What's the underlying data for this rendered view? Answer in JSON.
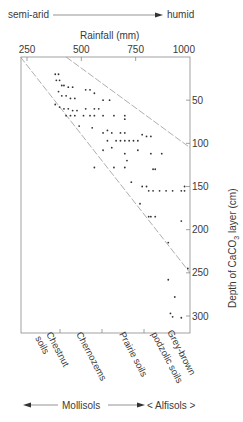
{
  "header": {
    "left_label": "semi-arid",
    "right_label": "humid"
  },
  "footer": {
    "left_label": "Mollisols",
    "right_label": "< Alfisols >"
  },
  "soil_labels": [
    {
      "line1": "Chestnut",
      "line2": "soils"
    },
    {
      "line1": "Chernozems",
      "line2": ""
    },
    {
      "line1": "Prairie soils",
      "line2": ""
    },
    {
      "line1": "Grey-brown",
      "line2": "podzolic soils"
    }
  ],
  "colors": {
    "axis": "#8a8a8a",
    "point": "#333333",
    "dashed": "#9a9a9a",
    "text": "#3a3a3a"
  },
  "chart_data": {
    "type": "scatter",
    "title": "",
    "xlabel": "Rainfall (mm)",
    "ylabel": "Depth of CaCO3 layer (cm)",
    "x_ticks": [
      250,
      500,
      750,
      1000
    ],
    "y_ticks": [
      50,
      100,
      150,
      200,
      250,
      300
    ],
    "xlim": [
      220,
      1000
    ],
    "ylim": [
      0,
      320
    ],
    "x_axis_position": "top",
    "y_axis_position": "right",
    "y_inverted": true,
    "grid": false,
    "legend": null,
    "annotations": [
      "semi-arid → humid",
      "Mollisols",
      "< Alfisols >",
      "Chestnut soils",
      "Chernozems",
      "Prairie soils",
      "Grey-brown podzolic soils"
    ],
    "envelope_lines": [
      {
        "name": "lower-bound",
        "points": [
          [
            220,
            0
          ],
          [
            1000,
            250
          ]
        ]
      },
      {
        "name": "upper-bound",
        "points": [
          [
            430,
            0
          ],
          [
            1000,
            105
          ]
        ]
      }
    ],
    "points": [
      [
        380,
        20
      ],
      [
        395,
        20
      ],
      [
        385,
        27
      ],
      [
        400,
        27
      ],
      [
        410,
        33
      ],
      [
        420,
        33
      ],
      [
        440,
        35
      ],
      [
        460,
        35
      ],
      [
        395,
        40
      ],
      [
        410,
        45
      ],
      [
        430,
        45
      ],
      [
        450,
        48
      ],
      [
        470,
        48
      ],
      [
        380,
        55
      ],
      [
        400,
        58
      ],
      [
        420,
        60
      ],
      [
        440,
        60
      ],
      [
        460,
        62
      ],
      [
        480,
        62
      ],
      [
        520,
        38
      ],
      [
        540,
        38
      ],
      [
        560,
        42
      ],
      [
        600,
        50
      ],
      [
        630,
        50
      ],
      [
        520,
        60
      ],
      [
        560,
        60
      ],
      [
        580,
        60
      ],
      [
        430,
        68
      ],
      [
        450,
        68
      ],
      [
        470,
        68
      ],
      [
        510,
        68
      ],
      [
        540,
        68
      ],
      [
        560,
        68
      ],
      [
        600,
        68
      ],
      [
        650,
        68
      ],
      [
        700,
        68
      ],
      [
        490,
        80
      ],
      [
        550,
        82
      ],
      [
        600,
        88
      ],
      [
        620,
        85
      ],
      [
        640,
        88
      ],
      [
        700,
        72
      ],
      [
        620,
        97
      ],
      [
        660,
        97
      ],
      [
        680,
        97
      ],
      [
        700,
        97
      ],
      [
        720,
        97
      ],
      [
        740,
        97
      ],
      [
        760,
        97
      ],
      [
        680,
        88
      ],
      [
        700,
        88
      ],
      [
        780,
        90
      ],
      [
        800,
        92
      ],
      [
        820,
        92
      ],
      [
        600,
        108
      ],
      [
        640,
        105
      ],
      [
        760,
        108
      ],
      [
        820,
        112
      ],
      [
        870,
        112
      ],
      [
        700,
        112
      ],
      [
        710,
        120
      ],
      [
        560,
        128
      ],
      [
        650,
        128
      ],
      [
        700,
        128
      ],
      [
        830,
        130
      ],
      [
        840,
        130
      ],
      [
        730,
        145
      ],
      [
        780,
        150
      ],
      [
        800,
        150
      ],
      [
        810,
        155
      ],
      [
        830,
        155
      ],
      [
        860,
        155
      ],
      [
        890,
        155
      ],
      [
        920,
        155
      ],
      [
        960,
        155
      ],
      [
        975,
        150
      ],
      [
        975,
        155
      ],
      [
        770,
        170
      ],
      [
        810,
        185
      ],
      [
        820,
        185
      ],
      [
        840,
        185
      ],
      [
        960,
        190
      ],
      [
        900,
        215
      ],
      [
        990,
        245
      ],
      [
        900,
        258
      ],
      [
        930,
        278
      ],
      [
        910,
        297
      ],
      [
        920,
        301
      ],
      [
        960,
        302
      ]
    ]
  }
}
